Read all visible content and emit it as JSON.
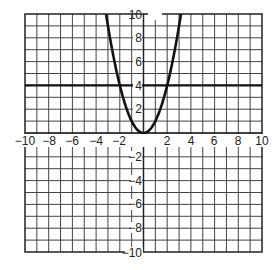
{
  "chart_data": {
    "type": "line",
    "title": "",
    "xlabel": "",
    "ylabel": "",
    "xlim": [
      -10,
      10
    ],
    "ylim": [
      -10,
      10
    ],
    "grid": true,
    "grid_step": 1,
    "x_tick_labels": [
      "-10",
      "-8",
      "-6",
      "-4",
      "-2",
      "2",
      "4",
      "6",
      "8",
      "10"
    ],
    "y_tick_labels": [
      "10",
      "8",
      "6",
      "4",
      "2",
      "-2",
      "-4",
      "-6",
      "-8",
      "-10"
    ],
    "series": [
      {
        "name": "parabola",
        "equation": "y = x^2",
        "points": [
          [
            -3.16,
            10
          ],
          [
            -3,
            9
          ],
          [
            -2,
            4
          ],
          [
            -1,
            1
          ],
          [
            0,
            0
          ],
          [
            1,
            1
          ],
          [
            2,
            4
          ],
          [
            3,
            9
          ],
          [
            3.16,
            10
          ]
        ]
      },
      {
        "name": "horizontal line",
        "equation": "y = 4",
        "points": [
          [
            -10,
            4
          ],
          [
            10,
            4
          ]
        ]
      }
    ],
    "intersections": [
      [
        -2,
        4
      ],
      [
        2,
        4
      ]
    ],
    "legend": "none"
  },
  "labels": {
    "x": {
      "m10": "−10",
      "m8": "−8",
      "m6": "−6",
      "m4": "−4",
      "m2": "−2",
      "p2": "2",
      "p4": "4",
      "p6": "6",
      "p8": "8",
      "p10": "10"
    },
    "y": {
      "p10": "10",
      "p8": "8",
      "p6": "6",
      "p4": "4",
      "p2": "2",
      "m2": "−2",
      "m4": "−4",
      "m6": "−6",
      "m8": "−8",
      "m10": "−10"
    }
  },
  "colors": {
    "grid": "#333333",
    "curve": "#111111",
    "background": "#ffffff"
  }
}
